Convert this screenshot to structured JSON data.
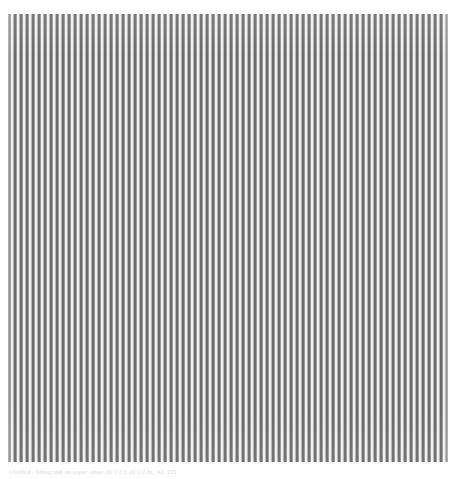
{
  "plate": {
    "kind": "artwork-reproduction",
    "medium_note": "vertical hard-edge stripe painting",
    "frame": {
      "left_px": 8,
      "top_px": 14,
      "width_px": 440,
      "height_px": 448
    }
  },
  "artwork": {
    "alt_text": "Field of evenly spaced vertical stripes alternating dark grey, mid grey and near-white, filling a square picture area on a white page.",
    "stripe": {
      "period_px": 6,
      "dark_width_px": 2,
      "mid_width_px": 1,
      "light_width_px": 2,
      "mid2_width_px": 1,
      "approx_count": 73,
      "orientation": "vertical"
    },
    "colors": {
      "dark": "#6a6a6a",
      "mid": "#9a9a9a",
      "mid2": "#b4b4b4",
      "light": "#f0f0f0",
      "page_background": "#ffffff"
    }
  },
  "caption": {
    "visible": true,
    "legible": false,
    "note": "single faint grey caption line beneath the plate; too low-contrast to transcribe",
    "title": "Untitled",
    "separator": ",",
    "rest": "lithograph on paper, sheet 20 1/2 x 20 1/2 in., ed. 125"
  }
}
